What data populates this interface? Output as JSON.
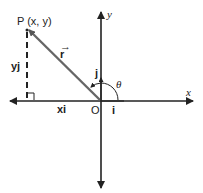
{
  "diagram": {
    "point_label": "P (x, y)",
    "vector_label": "r",
    "x_component_label": "xi",
    "y_component_label": "yj",
    "unit_i": "i",
    "unit_j": "j",
    "origin_label": "O",
    "angle_label": "θ",
    "x_axis_label": "x",
    "y_axis_label": "y"
  },
  "colors": {
    "axis": "#222222",
    "vector": "#555555",
    "background": "#ffffff"
  }
}
